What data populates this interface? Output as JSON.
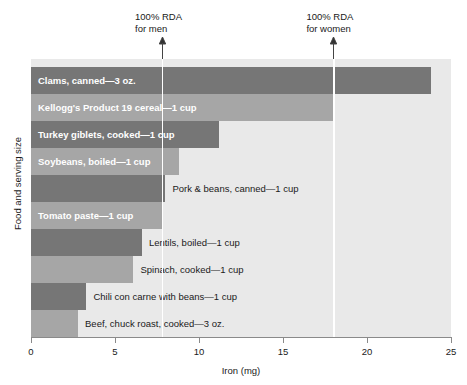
{
  "chart_data": {
    "type": "bar",
    "orientation": "horizontal",
    "title": "",
    "xlabel": "Iron (mg)",
    "ylabel": "Food and serving size",
    "xlim": [
      0,
      25
    ],
    "xticks": [
      0,
      5,
      10,
      15,
      20,
      25
    ],
    "xtick_labels": [
      "0",
      "5",
      "10",
      "15",
      "20",
      "25"
    ],
    "grid": false,
    "legend": "none",
    "categories": [
      "Clams, canned—3 oz.",
      "Kellogg's Product 19 cereal—1 cup",
      "Turkey giblets, cooked—1 cup",
      "Soybeans, boiled—1 cup",
      "Pork & beans, canned—1 cup",
      "Tomato paste—1 cup",
      "Lentils, boiled—1 cup",
      "Spinach, cooked—1 cup",
      "Chili con carne with beans—1 cup",
      "Beef, chuck roast, cooked—3 oz."
    ],
    "values": [
      23.8,
      18.0,
      11.2,
      8.8,
      8.0,
      7.8,
      6.6,
      6.1,
      3.3,
      2.8
    ],
    "bar_colors": [
      "#767676",
      "#a6a6a6",
      "#767676",
      "#a6a6a6",
      "#767676",
      "#a6a6a6",
      "#767676",
      "#a6a6a6",
      "#767676",
      "#a6a6a6"
    ],
    "label_placement": [
      "inside",
      "inside",
      "inside",
      "inside",
      "outside",
      "inside",
      "outside",
      "outside",
      "outside",
      "outside"
    ],
    "annotations": [
      {
        "name": "rda-men",
        "line1": "100% RDA",
        "line2": "for men",
        "value": 7.8
      },
      {
        "name": "rda-women",
        "line1": "100% RDA",
        "line2": "for women",
        "value": 18.0
      }
    ],
    "colors": {
      "plot_background": "#e9e9e9",
      "bar_dark": "#767676",
      "bar_light": "#a6a6a6",
      "reference_line": "#ffffff",
      "axis": "#8a8a8a",
      "text": "#1a1a1a",
      "inside_label_text": "#ffffff"
    }
  }
}
